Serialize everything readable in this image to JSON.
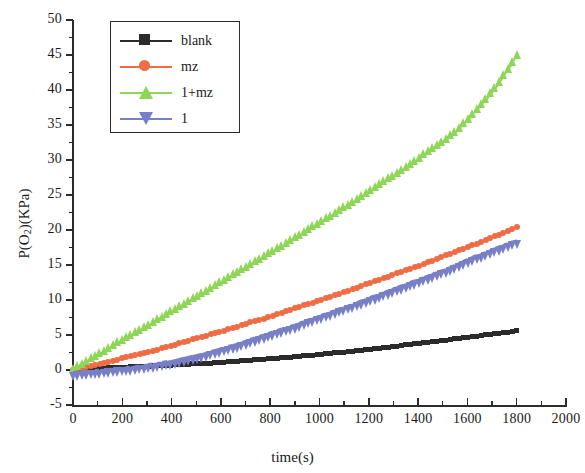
{
  "chart_data": {
    "type": "line",
    "title": "",
    "xlabel": "time(s)",
    "ylabel": "P(O2)(KPa)",
    "ylabel_base": "P(O",
    "ylabel_sub": "2",
    "ylabel_tail": ")(KPa)",
    "xlim": [
      0,
      2000
    ],
    "ylim": [
      -5,
      50
    ],
    "xticks": [
      0,
      200,
      400,
      600,
      800,
      1000,
      1200,
      1400,
      1600,
      1800,
      2000
    ],
    "yticks": [
      -5,
      0,
      5,
      10,
      15,
      20,
      25,
      30,
      35,
      40,
      45,
      50
    ],
    "x_minor_step": 100,
    "y_minor_step": 2.5,
    "grid": false,
    "legend_position": "upper-left",
    "x": [
      0,
      60,
      120,
      180,
      240,
      300,
      360,
      420,
      480,
      540,
      600,
      660,
      720,
      780,
      840,
      900,
      960,
      1020,
      1080,
      1140,
      1200,
      1260,
      1320,
      1380,
      1440,
      1500,
      1560,
      1620,
      1680,
      1740,
      1800
    ],
    "series": [
      {
        "name": "blank",
        "color": "#2b2b2b",
        "marker": "square",
        "values": [
          0.0,
          0.15,
          0.25,
          0.35,
          0.45,
          0.55,
          0.65,
          0.75,
          0.85,
          0.95,
          1.1,
          1.25,
          1.4,
          1.55,
          1.7,
          1.9,
          2.1,
          2.3,
          2.5,
          2.7,
          2.95,
          3.2,
          3.45,
          3.7,
          3.95,
          4.2,
          4.5,
          4.75,
          5.05,
          5.3,
          5.6
        ]
      },
      {
        "name": "mz",
        "color": "#ef6c45",
        "marker": "circle",
        "values": [
          0.0,
          0.5,
          1.0,
          1.5,
          2.0,
          2.5,
          3.1,
          3.7,
          4.3,
          4.9,
          5.5,
          6.1,
          6.8,
          7.4,
          8.1,
          8.8,
          9.5,
          10.2,
          10.9,
          11.6,
          12.4,
          13.1,
          13.9,
          14.6,
          15.4,
          16.2,
          17.0,
          17.8,
          18.7,
          19.5,
          20.4
        ]
      },
      {
        "name": "1+mz",
        "color": "#8ed756",
        "marker": "triangle-up",
        "values": [
          0.0,
          1.3,
          2.5,
          3.8,
          5.0,
          6.2,
          7.5,
          8.7,
          10.0,
          11.2,
          12.5,
          13.8,
          15.0,
          16.3,
          17.5,
          18.8,
          20.1,
          21.4,
          22.7,
          24.0,
          25.4,
          26.8,
          28.2,
          29.6,
          31.1,
          32.6,
          34.2,
          36.4,
          38.8,
          41.6,
          44.9
        ]
      },
      {
        "name": "1",
        "color": "#787fc6",
        "marker": "triangle-down",
        "values": [
          -0.3,
          -0.1,
          0.1,
          0.3,
          0.5,
          0.8,
          1.1,
          1.5,
          2.0,
          2.5,
          3.1,
          3.7,
          4.4,
          5.1,
          5.8,
          6.5,
          7.3,
          8.0,
          8.8,
          9.5,
          10.3,
          11.1,
          11.9,
          12.7,
          13.5,
          14.3,
          15.2,
          16.1,
          17.0,
          17.8,
          18.6
        ]
      }
    ]
  }
}
